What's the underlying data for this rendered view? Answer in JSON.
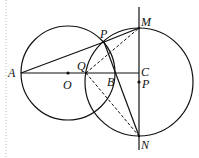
{
  "diagram": {
    "type": "geometry",
    "colors": {
      "stroke": "#111111",
      "background": "#ffffff",
      "margin_dots": "#bbbbbb"
    },
    "points": {
      "A": {
        "label": "A",
        "x": 21,
        "y": 73
      },
      "O": {
        "label": "O",
        "x": 68,
        "y": 73
      },
      "Q": {
        "label": "Q",
        "x": 86,
        "y": 73
      },
      "B": {
        "label": "B",
        "x": 116,
        "y": 73
      },
      "C": {
        "label": "C",
        "x": 139,
        "y": 73
      },
      "P_center": {
        "label": "P",
        "x": 139,
        "y": 82
      },
      "P_top": {
        "label": "P",
        "x": 104,
        "y": 42
      },
      "M": {
        "label": "M",
        "x": 139,
        "y": 28
      },
      "N": {
        "label": "N",
        "x": 139,
        "y": 136
      }
    },
    "circles": [
      {
        "name": "circle-O",
        "center": "O",
        "r": 47
      },
      {
        "name": "circle-P",
        "center": "P_center",
        "r": 54
      }
    ],
    "solid_segments": [
      [
        "A",
        "C"
      ],
      [
        "A",
        "P_top"
      ],
      [
        "P_top",
        "M"
      ],
      [
        "P_top",
        "N"
      ]
    ],
    "dashed_segments": [
      [
        "Q",
        "M"
      ],
      [
        "Q",
        "N"
      ]
    ],
    "vertical_line": {
      "x": 139,
      "y1": 7,
      "y2": 150
    }
  }
}
